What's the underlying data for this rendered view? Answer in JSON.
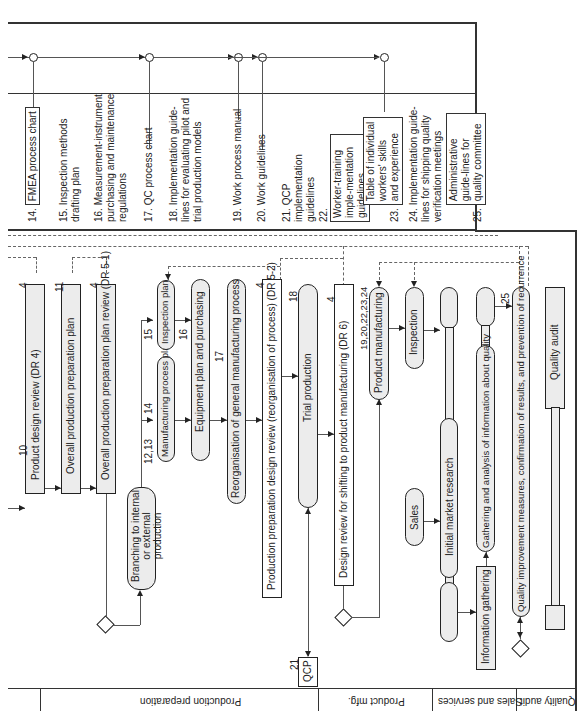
{
  "documents": [
    {
      "num": "14.",
      "text": "FMEA process chart",
      "framed": true
    },
    {
      "num": "15.",
      "text": "Inspection methods drafting plan",
      "framed": false
    },
    {
      "num": "16.",
      "text": "Measurement-instrument purchasing and maintenance regulations",
      "framed": false
    },
    {
      "num": "17.",
      "text": "QC process chart",
      "framed": false
    },
    {
      "num": "18.",
      "text": "Implementation guide-lines for evaluating pilot and trial production models",
      "framed": false
    },
    {
      "num": "19.",
      "text": "Work process manual",
      "framed": false
    },
    {
      "num": "20.",
      "text": "Work guidelines",
      "framed": false
    },
    {
      "num": "21.",
      "text": "QCP implementation guidelines",
      "framed": false
    },
    {
      "num": "22.",
      "text": "Worker-training imple-mentation guidelines",
      "framed": true
    },
    {
      "num": "23.",
      "text": "Table of individual workers' skills and experience",
      "framed": true
    },
    {
      "num": "24.",
      "text": "Implementation guide-lines for shipping quality verification meetings",
      "framed": false
    },
    {
      "num": "25.",
      "text": "Administrative guide-lines for quality committee",
      "framed": true
    }
  ],
  "lanes": [
    {
      "label": "Production preparation"
    },
    {
      "label": "Product mfg."
    },
    {
      "label": "Sales and services"
    },
    {
      "label": "Quality audit"
    }
  ],
  "nodes": {
    "product_design_review": {
      "label": "Product design review (DR 4)",
      "ref_top": "4",
      "ref_bottom": "10"
    },
    "overall_plan": {
      "label": "Overall production preparation plan",
      "ref_top": "11"
    },
    "overall_plan_review": {
      "label": "Overall production preparation plan review (DR 5-1)",
      "ref_top": "4"
    },
    "branching": {
      "label": "Branching to internal or external production"
    },
    "mfg_process_plan": {
      "label": "Manufacturing process plan",
      "ref": "12,13",
      "ref2": "14"
    },
    "inspection_plan": {
      "label": "Inspection plan",
      "ref": "15"
    },
    "equipment_plan": {
      "label": "Equipment plan and purchasing",
      "ref": "16"
    },
    "reorganisation": {
      "label": "Reorganisation of general manufacturing process",
      "ref": "17"
    },
    "prod_prep_design_review": {
      "label": "Production preparation design review (reorganisation of process) (DR 5-2)",
      "ref_top": "4"
    },
    "trial_production": {
      "label": "Trial production",
      "ref": "18"
    },
    "qcp": {
      "label": "QCP",
      "ref": "21"
    },
    "design_review_shift": {
      "label": "Design review for shifting to product manufacturing (DR 6)",
      "ref_top": "4"
    },
    "product_manufacturing": {
      "label": "Product manufacturing",
      "ref": "19,20,22,23,24"
    },
    "inspection": {
      "label": "Inspection"
    },
    "sales": {
      "label": "Sales"
    },
    "initial_market_research": {
      "label": "Initial market research"
    },
    "information_gathering": {
      "label": "Information gathering"
    },
    "gathering_analysis": {
      "label": "Gathering and analysis of information about quality"
    },
    "quality_improvement": {
      "label": "Quality improvement measures, confirmation of results, and prevention of recurrence",
      "ref": "25"
    },
    "quality_audit": {
      "label": "Quality audit"
    }
  }
}
